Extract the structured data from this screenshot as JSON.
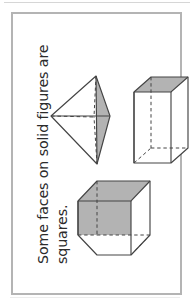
{
  "page": {
    "title": "Some faces on solid figures are squares.",
    "background_color": "#ffffff",
    "border_color": "#b4b4b4",
    "orientation": "rotated-90-ccw"
  },
  "caption": {
    "line1": "Some faces on solid figures are",
    "line2": "squares.",
    "full_text": "Some faces on solid figures are squares.",
    "text_color": "#2b2b2b",
    "rotation_degrees": -90
  },
  "figures": [
    {
      "id": "pyramid",
      "name": "triangular-pyramid",
      "label": "Triangular pyramid with one shaded triangular face",
      "shaded_faces": 1,
      "shade_color": "#b3b3b3",
      "outline_color": "#444444",
      "hidden_edges": "dashed"
    },
    {
      "id": "prism",
      "name": "rectangular-prism",
      "label": "Tall rectangular prism with shaded square top face",
      "shaded_faces": 1,
      "shade_color": "#b3b3b3",
      "outline_color": "#444444",
      "hidden_edges": "dashed"
    },
    {
      "id": "cube",
      "name": "cube",
      "label": "Cube with shaded top face and shaded left face",
      "shaded_faces": 2,
      "shade_color": "#b3b3b3",
      "outline_color": "#444444",
      "hidden_edges": "dashed"
    }
  ],
  "colors": {
    "shade_gray": "#b3b3b3",
    "shade_gray_dark": "#a8a8a8",
    "outline": "#444444",
    "page_border": "#b4b4b4",
    "scan_rule": "#d6d6d6"
  }
}
